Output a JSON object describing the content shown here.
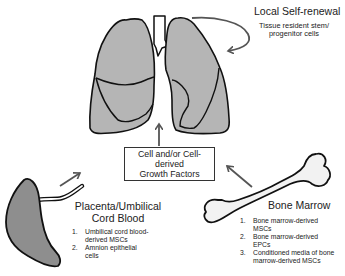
{
  "colors": {
    "organ_fill": "#b5b5b5",
    "outline": "#111111",
    "arrow": "#555555",
    "bone_fill": "#f2f2f2"
  },
  "local": {
    "title": "Local Self-renewal",
    "subtitle_line1": "Tissue resident stem/",
    "subtitle_line2": "progenitor cells"
  },
  "center_box": {
    "line1": "Cell and/or Cell-derived",
    "line2": "Growth Factors"
  },
  "placenta": {
    "title_line1": "Placenta/Umbilical",
    "title_line2": "Cord Blood",
    "items": [
      {
        "num": "1.",
        "line1": "Umbilical cord blood-",
        "line2": "derived MSCs"
      },
      {
        "num": "2.",
        "line1": "Amnion epithelial",
        "line2": "cells"
      }
    ]
  },
  "bone_marrow": {
    "title": "Bone Marrow",
    "items": [
      {
        "num": "1.",
        "line1": "Bone marrow-derived",
        "line2": "MSCs"
      },
      {
        "num": "2.",
        "line1": "Bone marrow-derived",
        "line2": "EPCs"
      },
      {
        "num": "3.",
        "line1": "Conditioned media of bone",
        "line2": "marrow-derived MSCs"
      }
    ]
  },
  "icons": {
    "lungs": "lungs-icon",
    "placenta": "placenta-icon",
    "bone": "bone-icon"
  }
}
